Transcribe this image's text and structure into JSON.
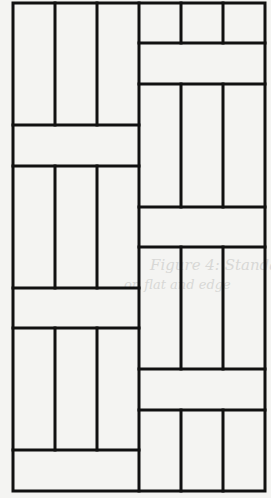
{
  "figure": {
    "frame": {
      "x": 13,
      "y": 3,
      "w": 252,
      "h": 488
    },
    "stroke_color": "#111111",
    "stroke_width": 3,
    "background": "#f4f4f2",
    "columns": [
      {
        "name": "left",
        "x0": 13,
        "x1": 139,
        "verticals": [
          55,
          97
        ],
        "blocks": [
          {
            "type": "vertical-triple",
            "y0": 3,
            "y1": 125
          },
          {
            "type": "horizontal",
            "y0": 125,
            "y1": 166
          },
          {
            "type": "vertical-triple",
            "y0": 166,
            "y1": 288
          },
          {
            "type": "horizontal",
            "y0": 288,
            "y1": 328
          },
          {
            "type": "vertical-triple",
            "y0": 328,
            "y1": 450
          },
          {
            "type": "horizontal",
            "y0": 450,
            "y1": 491
          }
        ]
      },
      {
        "name": "right",
        "x0": 139,
        "x1": 265,
        "verticals": [
          181,
          223
        ],
        "blocks": [
          {
            "type": "vertical-triple",
            "y0": 3,
            "y1": 43
          },
          {
            "type": "horizontal",
            "y0": 43,
            "y1": 84
          },
          {
            "type": "vertical-triple",
            "y0": 84,
            "y1": 207
          },
          {
            "type": "horizontal",
            "y0": 207,
            "y1": 247
          },
          {
            "type": "vertical-triple",
            "y0": 247,
            "y1": 369
          },
          {
            "type": "horizontal",
            "y0": 369,
            "y1": 410
          },
          {
            "type": "vertical-triple",
            "y0": 410,
            "y1": 491
          }
        ]
      }
    ]
  },
  "bleed_through_text": {
    "line1": "Figure 4: Standard brick",
    "line2": "on flat and edge"
  }
}
